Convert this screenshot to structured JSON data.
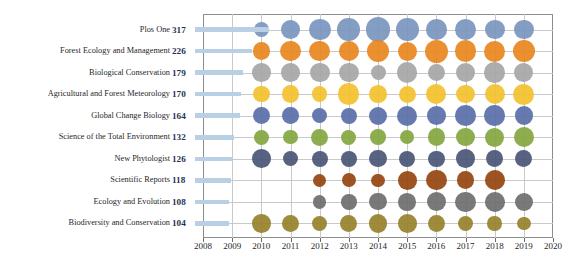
{
  "chart_data": {
    "type": "scatter",
    "title": "",
    "xlabel": "",
    "ylabel": "",
    "x": [
      2010,
      2011,
      2012,
      2013,
      2014,
      2015,
      2016,
      2017,
      2018,
      2019
    ],
    "xlim": [
      2008,
      2020
    ],
    "xticks": [
      "2008",
      "2009",
      "2010",
      "2011",
      "2012",
      "2013",
      "2014",
      "2015",
      "2016",
      "2017",
      "2018",
      "2019",
      "2020"
    ],
    "grid": true,
    "legend": "none",
    "size_encoding": "bubble area proportional to yearly publication count",
    "categories": [
      "Plos One",
      "Forest Ecology and Management",
      "Biological Conservation",
      "Agricultural and Forest Meteorology",
      "Global Change Biology",
      "Science of the Total Environment",
      "New Phytologist",
      "Scientific Reports",
      "Ecology and Evolution",
      "Biodiversity and Conservation"
    ],
    "totals": [
      317,
      226,
      179,
      170,
      164,
      132,
      126,
      118,
      108,
      104
    ],
    "colors": [
      "#7a95be",
      "#e8871f",
      "#a6a6a6",
      "#f2c12e",
      "#5a6fa8",
      "#83a640",
      "#4a5576",
      "#95440f",
      "#6e6e6e",
      "#96812a"
    ],
    "series": [
      {
        "name": "Plos One",
        "color": "#7a95be",
        "values": [
          11,
          22,
          29,
          32,
          40,
          32,
          25,
          28,
          22,
          21
        ]
      },
      {
        "name": "Forest Ecology and Management",
        "color": "#e8871f",
        "values": [
          16,
          24,
          24,
          22,
          31,
          20,
          33,
          27,
          26,
          30
        ]
      },
      {
        "name": "Biological Conservation",
        "color": "#a6a6a6",
        "values": [
          18,
          19,
          22,
          21,
          10,
          24,
          15,
          22,
          24,
          20
        ]
      },
      {
        "name": "Agricultural and Forest Meteorology",
        "color": "#f2c12e",
        "values": [
          13,
          16,
          11,
          27,
          16,
          15,
          22,
          19,
          23,
          26
        ]
      },
      {
        "name": "Global Change Biology",
        "color": "#5a6fa8",
        "values": [
          14,
          13,
          10,
          12,
          17,
          23,
          19,
          25,
          24,
          18
        ]
      },
      {
        "name": "Science of the Total Environment",
        "color": "#83a640",
        "values": [
          10,
          9,
          14,
          10,
          11,
          8,
          16,
          18,
          20,
          24
        ]
      },
      {
        "name": "New Phytologist",
        "color": "#4a5576",
        "values": [
          19,
          10,
          12,
          12,
          15,
          13,
          13,
          19,
          14,
          15
        ]
      },
      {
        "name": "Scientific Reports",
        "color": "#95440f",
        "values": [
          0,
          0,
          7,
          8,
          7,
          19,
          24,
          16,
          22,
          0
        ]
      },
      {
        "name": "Ecology and Evolution",
        "color": "#6e6e6e",
        "values": [
          0,
          0,
          7,
          11,
          15,
          16,
          20,
          23,
          22,
          18
        ]
      },
      {
        "name": "Biodiversity and Conservation",
        "color": "#96812a",
        "values": [
          18,
          15,
          10,
          15,
          18,
          19,
          14,
          11,
          9,
          7
        ]
      }
    ]
  }
}
